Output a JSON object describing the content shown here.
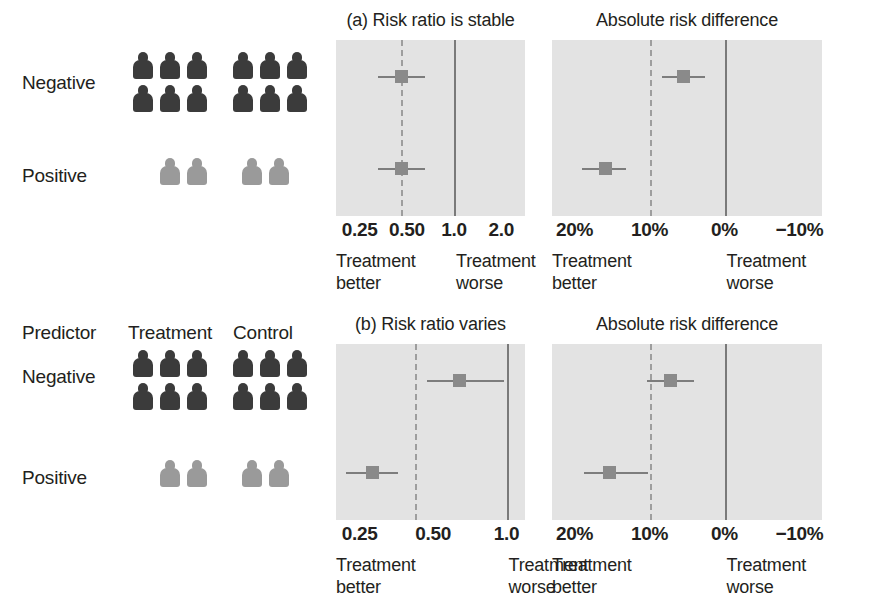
{
  "figure": {
    "background": "#ffffff",
    "plot_background": "#e3e3e3",
    "icon_dark_color": "#3b3b3b",
    "icon_light_color": "#9a9a9a",
    "marker_color": "#8a8a8a",
    "reference_line_color": "#7a7a7a"
  },
  "columns": {
    "predictor_header": "Predictor",
    "treatment_header": "Treatment",
    "control_header": "Control"
  },
  "rows": {
    "negative_label": "Negative",
    "positive_label": "Positive"
  },
  "pictograms": {
    "negative": {
      "treatment_count": 6,
      "control_count": 6,
      "shade": "dark",
      "rows": [
        3,
        3
      ]
    },
    "positive": {
      "treatment_count": 2,
      "control_count": 2,
      "shade": "light",
      "rows": [
        2
      ]
    }
  },
  "chart_data": [
    {
      "id": "a-risk-ratio",
      "type": "scatter",
      "title": "(a) Risk ratio is stable",
      "xlabel": "",
      "ylabel": "",
      "scale": "log",
      "xlim": [
        0.177,
        2.83
      ],
      "ticks": [
        {
          "label": "0.25",
          "value": 0.25
        },
        {
          "label": "0.50",
          "value": 0.5
        },
        {
          "label": "1.0",
          "value": 1.0
        },
        {
          "label": "2.0",
          "value": 2.0
        }
      ],
      "reference_lines": [
        {
          "value": 1.0,
          "style": "solid"
        },
        {
          "value": 0.46,
          "style": "dashed"
        }
      ],
      "categories": [
        "Negative",
        "Positive"
      ],
      "points": [
        {
          "category": "Negative",
          "estimate": 0.46,
          "low": 0.33,
          "high": 0.65
        },
        {
          "category": "Positive",
          "estimate": 0.46,
          "low": 0.33,
          "high": 0.65
        }
      ],
      "footnotes": [
        {
          "text": "Treatment\nbetter",
          "anchor": "left"
        },
        {
          "text": "Treatment\nworse",
          "anchor": "right"
        }
      ]
    },
    {
      "id": "a-risk-difference",
      "type": "scatter",
      "title": "Absolute risk difference",
      "xlabel": "",
      "ylabel": "",
      "scale": "linear",
      "xlim": [
        23,
        -13
      ],
      "ticks": [
        {
          "label": "20%",
          "value": 20
        },
        {
          "label": "10%",
          "value": 10
        },
        {
          "label": "0%",
          "value": 0
        },
        {
          "label": "−10%",
          "value": -10
        }
      ],
      "reference_lines": [
        {
          "value": 0,
          "style": "solid"
        },
        {
          "value": 10,
          "style": "dashed"
        }
      ],
      "categories": [
        "Negative",
        "Positive"
      ],
      "points": [
        {
          "category": "Negative",
          "estimate": 5.6,
          "low": 8.4,
          "high": 2.6
        },
        {
          "category": "Positive",
          "estimate": 16.0,
          "low": 19.0,
          "high": 13.2
        }
      ],
      "footnotes": [
        {
          "text": "Treatment\nbetter",
          "anchor": "left"
        },
        {
          "text": "Treatment\nworse",
          "anchor": "right"
        }
      ]
    },
    {
      "id": "b-risk-ratio",
      "type": "scatter",
      "title": "(b) Risk ratio varies",
      "xlabel": "",
      "ylabel": "",
      "scale": "log",
      "xlim": [
        0.2,
        1.19
      ],
      "ticks": [
        {
          "label": "0.25",
          "value": 0.25
        },
        {
          "label": "0.50",
          "value": 0.5
        },
        {
          "label": "1.0",
          "value": 1.0
        }
      ],
      "reference_lines": [
        {
          "value": 1.0,
          "style": "solid"
        },
        {
          "value": 0.42,
          "style": "dashed"
        }
      ],
      "categories": [
        "Negative",
        "Positive"
      ],
      "points": [
        {
          "category": "Negative",
          "estimate": 0.64,
          "low": 0.47,
          "high": 0.98
        },
        {
          "category": "Positive",
          "estimate": 0.28,
          "low": 0.22,
          "high": 0.36
        }
      ],
      "footnotes": [
        {
          "text": "Treatment\nbetter",
          "anchor": "left"
        },
        {
          "text": "Treatment\nworse",
          "anchor": "right"
        }
      ]
    },
    {
      "id": "b-risk-difference",
      "type": "scatter",
      "title": "Absolute risk difference",
      "xlabel": "",
      "ylabel": "",
      "scale": "linear",
      "xlim": [
        23,
        -13
      ],
      "ticks": [
        {
          "label": "20%",
          "value": 20
        },
        {
          "label": "10%",
          "value": 10
        },
        {
          "label": "0%",
          "value": 0
        },
        {
          "label": "−10%",
          "value": -10
        }
      ],
      "reference_lines": [
        {
          "value": 0,
          "style": "solid"
        },
        {
          "value": 10,
          "style": "dashed"
        }
      ],
      "categories": [
        "Negative",
        "Positive"
      ],
      "points": [
        {
          "category": "Negative",
          "estimate": 7.3,
          "low": 10.4,
          "high": 4.1
        },
        {
          "category": "Positive",
          "estimate": 15.4,
          "low": 18.8,
          "high": 10.2
        }
      ],
      "footnotes": [
        {
          "text": "Treatment\nbetter",
          "anchor": "left"
        },
        {
          "text": "Treatment\nworse",
          "anchor": "right"
        }
      ]
    }
  ]
}
